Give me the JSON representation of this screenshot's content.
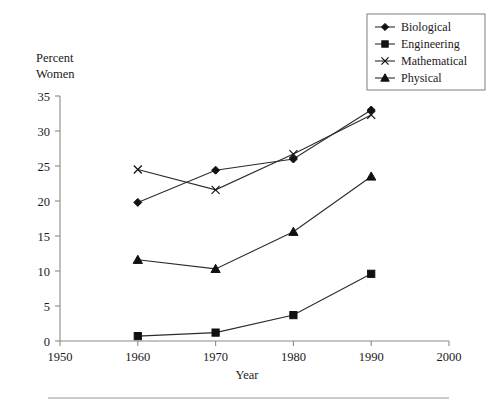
{
  "chart_data": {
    "type": "line",
    "title": "",
    "xlabel": "Year",
    "ylabel": "Percent Women",
    "ylabel_line1": "Percent",
    "ylabel_line2": "Women",
    "x": [
      1960,
      1970,
      1980,
      1990
    ],
    "xlim": [
      1950,
      2000
    ],
    "ylim": [
      0,
      35
    ],
    "xticks": [
      1950,
      1960,
      1970,
      1980,
      1990,
      2000
    ],
    "yticks": [
      0,
      5,
      10,
      15,
      20,
      25,
      30,
      35
    ],
    "xtick_labels": [
      "1950",
      "1960",
      "1970",
      "1980",
      "1990",
      "2000"
    ],
    "ytick_labels": [
      "0",
      "5",
      "10",
      "15",
      "20",
      "25",
      "30",
      "35"
    ],
    "grid": false,
    "legend_position": "top-right",
    "series": [
      {
        "name": "Biological",
        "marker": "diamond",
        "color": "#111111",
        "values": [
          19.8,
          24.4,
          26.0,
          33.0
        ]
      },
      {
        "name": "Engineering",
        "marker": "square",
        "color": "#111111",
        "values": [
          0.7,
          1.2,
          3.7,
          9.6
        ]
      },
      {
        "name": "Mathematical",
        "marker": "cross",
        "color": "#111111",
        "values": [
          24.5,
          21.6,
          26.7,
          32.3
        ]
      },
      {
        "name": "Physical",
        "marker": "triangle",
        "color": "#111111",
        "values": [
          11.6,
          10.3,
          15.6,
          23.5
        ]
      }
    ]
  },
  "legend": {
    "items": [
      {
        "label": "Biological"
      },
      {
        "label": "Engineering"
      },
      {
        "label": "Mathematical"
      },
      {
        "label": "Physical"
      }
    ]
  },
  "axis": {
    "x_title": "Year",
    "y_title_line1": "Percent",
    "y_title_line2": "Women"
  }
}
